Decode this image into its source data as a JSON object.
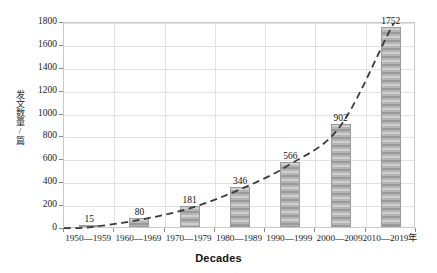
{
  "chart_data": {
    "type": "bar",
    "title": "",
    "xlabel": "Decades",
    "ylabel": "发文数量/篇",
    "categories": [
      "1950—1959",
      "1960—1969",
      "1970—1979",
      "1980—1989",
      "1990—1999",
      "2000—2009",
      "2010—2019年"
    ],
    "values": [
      15,
      80,
      181,
      346,
      566,
      902,
      1752
    ],
    "ylim": [
      0,
      1800
    ],
    "yticks": [
      0,
      200,
      400,
      600,
      800,
      1000,
      1200,
      1400,
      1600,
      1800
    ],
    "ytick_labels": [
      "0",
      "200",
      "400",
      "600",
      "800",
      "1000",
      "1200",
      "1400",
      "1600",
      "1800"
    ],
    "grid": true,
    "legend": "none",
    "series": [
      {
        "name": "发文数量/篇",
        "type": "bar",
        "values": [
          15,
          80,
          181,
          346,
          566,
          902,
          1752
        ],
        "color": "#a8a8a8",
        "pattern": "horizontal-stripes"
      },
      {
        "name": "trend",
        "type": "line",
        "style": "dashed",
        "color": "#3a3a3a",
        "values": [
          15,
          80,
          181,
          346,
          566,
          902,
          1752
        ]
      }
    ],
    "data_labels": [
      "15",
      "80",
      "181",
      "346",
      "566",
      "902",
      "1752"
    ],
    "colors": {
      "bar_fill": "#a8a8a8",
      "bar_edge": "#9b9b9b",
      "grid": "#e2e2e2",
      "axis": "#c9c9c9",
      "trend_line": "#3a3a3a",
      "text": "#111111"
    }
  }
}
